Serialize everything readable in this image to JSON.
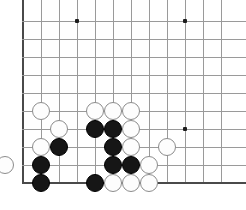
{
  "board": {
    "title": "Go board corner position",
    "size_label": "19x19",
    "visible_columns": 12,
    "visible_rows": 10,
    "cell_px": 18,
    "origin_x": 23,
    "origin_y": 21,
    "stone_radius_px": 9,
    "colors": {
      "background": "#ffffff",
      "grid_line": "#9a9a9a",
      "edge_line": "#4a4a4a",
      "black_stone": "#161616",
      "white_stone": "#fdfdfd",
      "white_stone_border": "#8c8c8c",
      "star_point": "#1d1d1d"
    },
    "edges": {
      "left_edge_col": 0,
      "bottom_edge_row": 9,
      "top_open": true,
      "right_open": true
    },
    "star_points": [
      {
        "col": 3,
        "row": 0,
        "name": "star-point-upper-left"
      },
      {
        "col": 9,
        "row": 0,
        "name": "star-point-upper-right"
      },
      {
        "col": 9,
        "row": 6,
        "name": "star-point-right-center"
      }
    ],
    "stones": [
      {
        "id": "w1",
        "color": "white",
        "col": 1,
        "row": 5
      },
      {
        "id": "w2",
        "color": "white",
        "col": 4,
        "row": 5
      },
      {
        "id": "w3",
        "color": "white",
        "col": 5,
        "row": 5
      },
      {
        "id": "w4",
        "color": "white",
        "col": 6,
        "row": 5
      },
      {
        "id": "w5",
        "color": "white",
        "col": 2,
        "row": 6
      },
      {
        "id": "b1",
        "color": "black",
        "col": 4,
        "row": 6
      },
      {
        "id": "b2",
        "color": "black",
        "col": 5,
        "row": 6
      },
      {
        "id": "w6",
        "color": "white",
        "col": 6,
        "row": 6
      },
      {
        "id": "w7",
        "color": "white",
        "col": 1,
        "row": 7
      },
      {
        "id": "b3",
        "color": "black",
        "col": 2,
        "row": 7
      },
      {
        "id": "b4",
        "color": "black",
        "col": 5,
        "row": 7
      },
      {
        "id": "w8",
        "color": "white",
        "col": 6,
        "row": 7
      },
      {
        "id": "w9",
        "color": "white",
        "col": 8,
        "row": 7
      },
      {
        "id": "w10",
        "color": "white",
        "col": -1,
        "row": 8
      },
      {
        "id": "b5",
        "color": "black",
        "col": 1,
        "row": 8
      },
      {
        "id": "b6",
        "color": "black",
        "col": 5,
        "row": 8
      },
      {
        "id": "b7",
        "color": "black",
        "col": 6,
        "row": 8
      },
      {
        "id": "w11",
        "color": "white",
        "col": 7,
        "row": 8
      },
      {
        "id": "b8",
        "color": "black",
        "col": 1,
        "row": 9
      },
      {
        "id": "b9",
        "color": "black",
        "col": 4,
        "row": 9
      },
      {
        "id": "w12",
        "color": "white",
        "col": 5,
        "row": 9
      },
      {
        "id": "w13",
        "color": "white",
        "col": 6,
        "row": 9
      },
      {
        "id": "w14",
        "color": "white",
        "col": 7,
        "row": 9
      }
    ],
    "counts": {
      "black_stones": "9",
      "white_stones": "14",
      "total_stones": "23"
    }
  }
}
